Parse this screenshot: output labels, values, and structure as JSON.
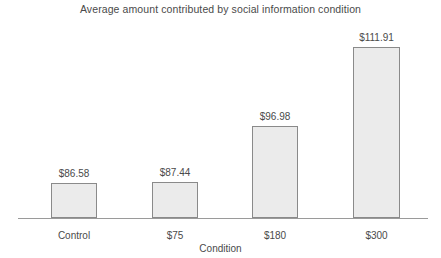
{
  "chart_data": {
    "type": "bar",
    "title": "Average amount contributed by social information condition",
    "xlabel": "Condition",
    "ylabel": "",
    "categories": [
      "Control",
      "$75",
      "$180",
      "$300"
    ],
    "values": [
      86.58,
      87.44,
      96.98,
      111.91
    ],
    "value_labels": [
      "$86.58",
      "$87.44",
      "$96.98",
      "$111.91"
    ],
    "grid": false,
    "legend": null,
    "ylim": [
      82,
      115
    ],
    "axis": {
      "x_axis_visible": true,
      "y_axis_visible": false
    },
    "bars": [
      {
        "category": "Control",
        "value": 86.58,
        "label": "$86.58",
        "left": 51,
        "width": 46,
        "height": 35
      },
      {
        "category": "$75",
        "value": 87.44,
        "label": "$87.44",
        "left": 152,
        "width": 46,
        "height": 36
      },
      {
        "category": "$180",
        "value": 96.98,
        "label": "$96.98",
        "left": 252,
        "width": 46,
        "height": 92
      },
      {
        "category": "$300",
        "value": 111.91,
        "label": "$111.91",
        "left": 353,
        "width": 47,
        "height": 171
      }
    ],
    "colors": {
      "bar_fill": "#ebebeb",
      "bar_border": "#8a8a8a",
      "axis": "#9a9a9a",
      "text": "#4a4a4a",
      "background": "#ffffff"
    }
  }
}
